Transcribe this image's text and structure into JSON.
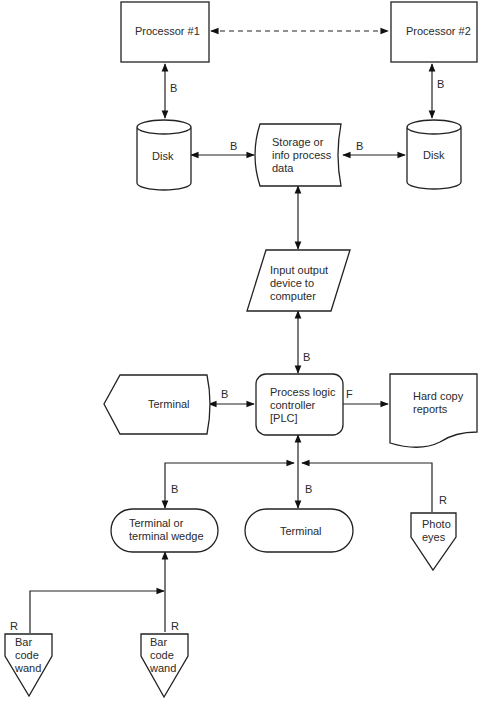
{
  "diagram": {
    "type": "flowchart",
    "nodes": {
      "processor1": {
        "label": [
          "Processor #1"
        ],
        "shape": "rectangle"
      },
      "processor2": {
        "label": [
          "Processor #2"
        ],
        "shape": "rectangle"
      },
      "disk1": {
        "label": [
          "Disk"
        ],
        "shape": "cylinder"
      },
      "disk2": {
        "label": [
          "Disk"
        ],
        "shape": "cylinder"
      },
      "storage": {
        "label": [
          "Storage or",
          "info process",
          "data"
        ],
        "shape": "stored-data"
      },
      "io_device": {
        "label": [
          "Input output",
          "device to",
          "computer"
        ],
        "shape": "parallelogram"
      },
      "plc": {
        "label": [
          "Process logic",
          "controller",
          "[PLC]"
        ],
        "shape": "rounded-rectangle"
      },
      "terminal_display": {
        "label": [
          "Terminal"
        ],
        "shape": "display"
      },
      "hard_copy": {
        "label": [
          "Hard copy",
          "reports"
        ],
        "shape": "document"
      },
      "terminal_wedge": {
        "label": [
          "Terminal or",
          "terminal wedge"
        ],
        "shape": "terminator"
      },
      "terminal": {
        "label": [
          "Terminal"
        ],
        "shape": "terminator"
      },
      "photo_eyes": {
        "label": [
          "Photo",
          "eyes"
        ],
        "shape": "off-page-connector"
      },
      "bar_code_wand_1": {
        "label": [
          "Bar",
          "code",
          "wand"
        ],
        "shape": "off-page-connector"
      },
      "bar_code_wand_2": {
        "label": [
          "Bar",
          "code",
          "wand"
        ],
        "shape": "off-page-connector"
      }
    },
    "edges": [
      {
        "from": "processor1",
        "to": "processor2",
        "label": "",
        "style": "dashed",
        "direction": "both"
      },
      {
        "from": "processor1",
        "to": "disk1",
        "label": "B",
        "direction": "both"
      },
      {
        "from": "processor2",
        "to": "disk2",
        "label": "B",
        "direction": "both"
      },
      {
        "from": "disk1",
        "to": "storage",
        "label": "B",
        "direction": "both"
      },
      {
        "from": "storage",
        "to": "disk2",
        "label": "B",
        "direction": "both"
      },
      {
        "from": "storage",
        "to": "io_device",
        "label": "",
        "direction": "both"
      },
      {
        "from": "io_device",
        "to": "plc",
        "label": "B",
        "direction": "both"
      },
      {
        "from": "terminal_display",
        "to": "plc",
        "label": "B",
        "direction": "both"
      },
      {
        "from": "plc",
        "to": "hard_copy",
        "label": "F",
        "direction": "forward"
      },
      {
        "from": "plc",
        "to": "terminal_wedge",
        "label": "B",
        "direction": "both"
      },
      {
        "from": "plc",
        "to": "terminal",
        "label": "B",
        "direction": "both"
      },
      {
        "from": "photo_eyes",
        "to": "plc",
        "label": "R",
        "direction": "forward"
      },
      {
        "from": "bar_code_wand_1",
        "to": "terminal_wedge",
        "label": "R",
        "direction": "forward"
      },
      {
        "from": "bar_code_wand_2",
        "to": "terminal_wedge",
        "label": "R",
        "direction": "forward"
      }
    ],
    "edge_labels": {
      "b": "B",
      "f": "F",
      "r": "R"
    }
  }
}
